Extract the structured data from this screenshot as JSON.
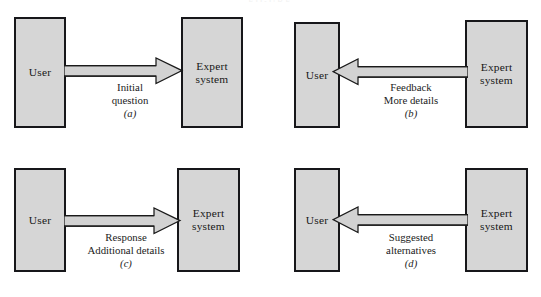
{
  "figure": {
    "title_clipped": "FIGURE",
    "background_color": "#ffffff",
    "box_fill_color": "#d6d6d6",
    "box_border_color": "#17171a",
    "arrow_fill_color": "#d0d0d0",
    "arrow_outline_color": "#1a1a1a",
    "text_color": "#1b1b1b"
  },
  "panels": [
    {
      "key": "a",
      "sub_label": "(a)",
      "left_box": "User",
      "right_box": "Expert\nsystem",
      "arrow_direction": "right",
      "caption": "Initial\nquestion",
      "caption_lines": [
        "Initial",
        "question"
      ]
    },
    {
      "key": "b",
      "sub_label": "(b)",
      "left_box": "User",
      "right_box": "Expert\nsystem",
      "arrow_direction": "left",
      "caption": "Feedback\nMore details",
      "caption_lines": [
        "Feedback",
        "More details"
      ]
    },
    {
      "key": "c",
      "sub_label": "(c)",
      "left_box": "User",
      "right_box": "Expert\nsystem",
      "arrow_direction": "right",
      "caption": "Response\nAdditional details",
      "caption_lines": [
        "Response",
        "Additional details"
      ]
    },
    {
      "key": "d",
      "sub_label": "(d)",
      "left_box": "User",
      "right_box": "Expert\nsystem",
      "arrow_direction": "left",
      "caption": "Suggested\nalternatives",
      "caption_lines": [
        "Suggested",
        "alternatives"
      ]
    }
  ]
}
